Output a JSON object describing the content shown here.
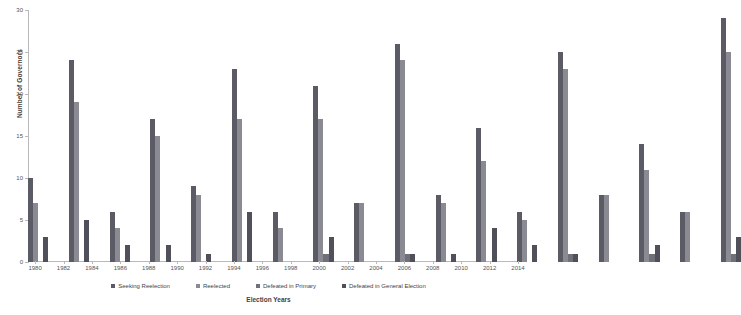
{
  "chart_data": {
    "type": "bar",
    "title": "",
    "xlabel": "Election Years",
    "ylabel": "Number of Governors",
    "ylim": [
      0,
      30
    ],
    "ytick_labels": [
      "0",
      "5",
      "10",
      "15",
      "20",
      "25",
      "30"
    ],
    "ytick_values": [
      0,
      5,
      10,
      15,
      20,
      25,
      30
    ],
    "grid": false,
    "legend_position": "bottom",
    "categories": [
      "1980",
      "1981",
      "1982",
      "1983",
      "1984",
      "1985",
      "1986",
      "1987",
      "1988",
      "1989",
      "1990",
      "1991",
      "1992",
      "1993",
      "1994",
      "1995",
      "1996",
      "1997",
      "1998",
      "1999",
      "2000",
      "2001",
      "2002",
      "2003",
      "2004",
      "2005",
      "2006",
      "2007",
      "2008",
      "2009",
      "2010",
      "2011",
      "2012",
      "2013",
      "2014"
    ],
    "visible_tick_labels": [
      "1980",
      "",
      "1982",
      "",
      "1984",
      "",
      "1986",
      "",
      "1988",
      "",
      "1990",
      "",
      "1992",
      "",
      "1994",
      "",
      "1996",
      "",
      "1998",
      "",
      "2000",
      "",
      "2002",
      "",
      "2004",
      "",
      "2006",
      "",
      "2008",
      "",
      "2010",
      "",
      "2012",
      "",
      "2014"
    ],
    "series": [
      {
        "name": "Seeking Reelection",
        "color": "#5b5b66",
        "values": [
          10,
          0,
          24,
          0,
          6,
          0,
          17,
          0,
          9,
          0,
          23,
          0,
          6,
          0,
          21,
          0,
          7,
          0,
          26,
          0,
          8,
          0,
          16,
          0,
          6,
          0,
          25,
          0,
          8,
          0,
          14,
          0,
          6,
          0,
          29
        ]
      },
      {
        "name": "Reelected",
        "color": "#8a8a92",
        "values": [
          7,
          0,
          19,
          0,
          4,
          0,
          15,
          0,
          8,
          0,
          17,
          0,
          4,
          0,
          17,
          0,
          7,
          0,
          24,
          0,
          7,
          0,
          12,
          0,
          5,
          0,
          23,
          0,
          8,
          0,
          11,
          0,
          6,
          0,
          25
        ]
      },
      {
        "name": "Defeated in Primary",
        "color": "#707078",
        "values": [
          0,
          0,
          0,
          0,
          0,
          0,
          0,
          0,
          0,
          0,
          0,
          0,
          0,
          0,
          1,
          0,
          0,
          0,
          1,
          0,
          0,
          0,
          0,
          0,
          0,
          0,
          1,
          0,
          0,
          0,
          1,
          0,
          0,
          0,
          1
        ]
      },
      {
        "name": "Defeated in General Election",
        "color": "#50505a",
        "values": [
          3,
          0,
          5,
          0,
          2,
          0,
          2,
          0,
          1,
          0,
          6,
          0,
          0,
          0,
          3,
          0,
          0,
          0,
          1,
          0,
          1,
          0,
          4,
          0,
          2,
          0,
          1,
          0,
          0,
          0,
          2,
          0,
          0,
          0,
          3
        ]
      }
    ]
  },
  "legend": {
    "items": [
      {
        "label": "Seeking Reelection"
      },
      {
        "label": "Reelected"
      },
      {
        "label": "Defeated in Primary"
      },
      {
        "label": "Defeated in General Election"
      }
    ]
  }
}
